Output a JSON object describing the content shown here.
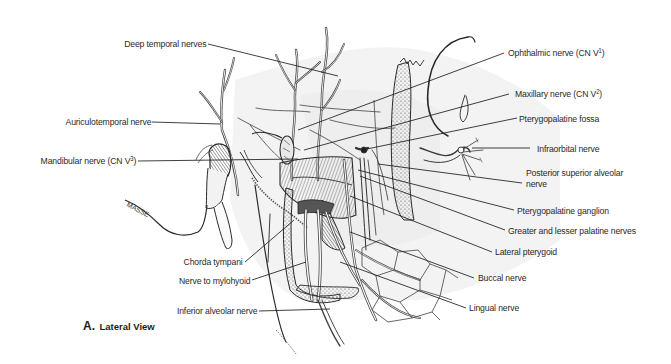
{
  "figure": {
    "caption_letter": "A.",
    "caption_text": "Lateral View",
    "muscle_inscription": "MASSE"
  },
  "labels_left": [
    {
      "id": "deep-temporal-nerves",
      "text": "Deep temporal nerves"
    },
    {
      "id": "auriculotemporal-nerve",
      "text": "Auriculotemporal nerve"
    },
    {
      "id": "mandibular-nerve",
      "text": "Mandibular nerve (CN V",
      "sup": "3",
      "tail": ")"
    },
    {
      "id": "chorda-tympani",
      "text": "Chorda tympani"
    },
    {
      "id": "nerve-to-mylohyoid",
      "text": "Nerve to mylohyoid"
    },
    {
      "id": "inferior-alveolar-nerve",
      "text": "Inferior alveolar nerve"
    }
  ],
  "labels_right": [
    {
      "id": "ophthalmic-nerve",
      "text": "Ophthalmic nerve (CN V",
      "sup": "1",
      "tail": ")"
    },
    {
      "id": "maxillary-nerve",
      "text": "Maxillary nerve (CN V",
      "sup": "2",
      "tail": ")"
    },
    {
      "id": "pterygopalatine-fossa",
      "text": "Pterygopalatine fossa"
    },
    {
      "id": "infraorbital-nerve",
      "text": "Infraorbital nerve"
    },
    {
      "id": "posterior-superior-alveolar-nerve",
      "text": "Posterior superior alveolar",
      "line2": "nerve"
    },
    {
      "id": "pterygopalatine-ganglion",
      "text": "Pterygopalatine ganglion"
    },
    {
      "id": "greater-lesser-palatine-nerves",
      "text": "Greater and lesser palatine nerves"
    },
    {
      "id": "lateral-pterygoid",
      "text": "Lateral pterygoid"
    },
    {
      "id": "buccal-nerve",
      "text": "Buccal nerve"
    },
    {
      "id": "lingual-nerve",
      "text": "Lingual nerve"
    }
  ],
  "colors": {
    "ink": "#2a2a2a",
    "leader": "#1e1e1e",
    "shade": "#6a6a6a",
    "background": "#ffffff"
  }
}
